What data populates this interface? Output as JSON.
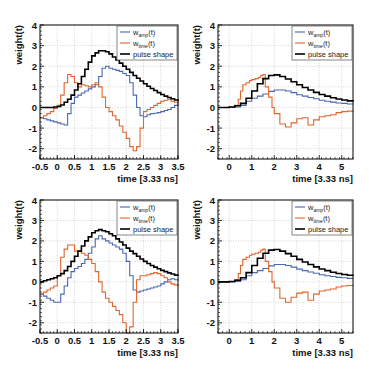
{
  "colors": {
    "amp": "#4a68b0",
    "time": "#e0662e",
    "pulse": "#000000",
    "grid": "#b8b8b8",
    "axis": "#000000"
  },
  "legend": {
    "amp_main": "w",
    "amp_sub": "amp",
    "amp_tail": "(t)",
    "time_main": "w",
    "time_sub": "time",
    "time_tail": "(t)",
    "pulse": "pulse shape"
  },
  "chart_data": [
    {
      "type": "line",
      "panel": "top-left",
      "title": "",
      "xlabel": "time [3.33 ns]",
      "ylabel": "weight(t)",
      "xlim": [
        -0.5,
        3.5
      ],
      "ylim": [
        -2.5,
        4
      ],
      "xticks": [
        -0.5,
        0,
        0.5,
        1,
        1.5,
        2,
        2.5,
        3,
        3.5
      ],
      "xtick_labels": [
        "-0.5",
        "0",
        "0.5",
        "1",
        "1.5",
        "2",
        "2.5",
        "3",
        "3.5"
      ],
      "yticks": [
        -2,
        -1,
        0,
        1,
        2,
        3,
        4
      ],
      "ytick_labels": [
        "-2",
        "-1",
        "0",
        "1",
        "2",
        "3",
        "4"
      ],
      "grid": true,
      "legend_position": "upper right",
      "step": true,
      "series": [
        {
          "name": "w_amp(t)",
          "x": [
            -0.5,
            -0.4,
            -0.3,
            -0.2,
            -0.1,
            0,
            0.1,
            0.2,
            0.3,
            0.4,
            0.5,
            0.6,
            0.7,
            0.8,
            0.9,
            1.0,
            1.1,
            1.2,
            1.3,
            1.4,
            1.5,
            1.6,
            1.7,
            1.8,
            1.9,
            2.0,
            2.1,
            2.2,
            2.3,
            2.4,
            2.5,
            2.6,
            2.7,
            2.8,
            2.9,
            3.0,
            3.1,
            3.2,
            3.3,
            3.4,
            3.5
          ],
          "y": [
            -0.5,
            -0.55,
            -0.6,
            -0.65,
            -0.7,
            -0.75,
            -0.8,
            -0.85,
            -0.3,
            0.2,
            0.5,
            0.6,
            0.7,
            0.8,
            0.9,
            1.0,
            1.1,
            1.5,
            1.9,
            2.0,
            1.9,
            1.85,
            1.8,
            1.75,
            1.65,
            1.55,
            1.2,
            0.6,
            0,
            -0.4,
            -0.45,
            -0.35,
            -0.3,
            -0.28,
            -0.25,
            -0.2,
            -0.15,
            -0.1,
            0,
            0.1,
            0.2
          ]
        },
        {
          "name": "w_time(t)",
          "x": [
            -0.5,
            -0.4,
            -0.3,
            -0.2,
            -0.1,
            0,
            0.1,
            0.2,
            0.3,
            0.4,
            0.5,
            0.6,
            0.7,
            0.8,
            0.9,
            1.0,
            1.1,
            1.2,
            1.3,
            1.4,
            1.5,
            1.6,
            1.7,
            1.8,
            1.9,
            2.0,
            2.1,
            2.2,
            2.3,
            2.4,
            2.5,
            2.6,
            2.7,
            2.8,
            2.9,
            3.0,
            3.1,
            3.2,
            3.3,
            3.4,
            3.5
          ],
          "y": [
            -0.5,
            -0.4,
            -0.3,
            -0.2,
            -0.05,
            0.1,
            0.6,
            1.2,
            1.6,
            1.5,
            1.2,
            1.0,
            1.1,
            1.05,
            1.0,
            1.1,
            1.2,
            1.0,
            0.5,
            0,
            -0.2,
            -0.4,
            -0.6,
            -0.9,
            -1.2,
            -1.5,
            -1.9,
            -2.1,
            -1.9,
            -1.0,
            -0.2,
            -0.1,
            0,
            0.1,
            0.2,
            0.3,
            0.35,
            0.4,
            0.3,
            0.25,
            0.2
          ]
        },
        {
          "name": "pulse shape",
          "x": [
            -0.5,
            -0.4,
            -0.3,
            -0.2,
            -0.1,
            0,
            0.1,
            0.2,
            0.3,
            0.4,
            0.5,
            0.6,
            0.7,
            0.8,
            0.9,
            1.0,
            1.1,
            1.2,
            1.3,
            1.4,
            1.5,
            1.6,
            1.7,
            1.8,
            1.9,
            2.0,
            2.1,
            2.2,
            2.3,
            2.4,
            2.5,
            2.6,
            2.7,
            2.8,
            2.9,
            3.0,
            3.1,
            3.2,
            3.3,
            3.4,
            3.5
          ],
          "y": [
            0,
            0,
            0,
            0,
            0.02,
            0.05,
            0.12,
            0.25,
            0.4,
            0.6,
            0.85,
            1.15,
            1.5,
            1.85,
            2.2,
            2.5,
            2.65,
            2.75,
            2.75,
            2.7,
            2.6,
            2.45,
            2.3,
            2.15,
            2.0,
            1.85,
            1.7,
            1.55,
            1.42,
            1.28,
            1.15,
            1.03,
            0.92,
            0.82,
            0.72,
            0.63,
            0.55,
            0.48,
            0.42,
            0.36,
            0.3
          ]
        }
      ]
    },
    {
      "type": "line",
      "panel": "top-right",
      "title": "",
      "xlabel": "time [3.33 ns]",
      "ylabel": "weight(t)",
      "xlim": [
        -0.5,
        5.5
      ],
      "ylim": [
        -2.5,
        4
      ],
      "xticks": [
        0,
        1,
        2,
        3,
        4,
        5
      ],
      "xtick_labels": [
        "0",
        "1",
        "2",
        "3",
        "4",
        "5"
      ],
      "yticks": [
        -2,
        -1,
        0,
        1,
        2,
        3,
        4
      ],
      "ytick_labels": [
        "-2",
        "-1",
        "0",
        "1",
        "2",
        "3",
        "4"
      ],
      "grid": true,
      "legend_position": "upper right",
      "step": true,
      "series": [
        {
          "name": "w_amp(t)",
          "x": [
            -0.5,
            0,
            0.25,
            0.5,
            0.75,
            1.0,
            1.25,
            1.5,
            1.75,
            2.0,
            2.25,
            2.5,
            2.75,
            3.0,
            3.25,
            3.5,
            3.75,
            4.0,
            4.25,
            4.5,
            4.75,
            5.0,
            5.25,
            5.5
          ],
          "y": [
            0,
            0,
            0.02,
            0.1,
            0.3,
            0.45,
            0.55,
            0.65,
            0.78,
            0.85,
            0.85,
            0.8,
            0.72,
            0.62,
            0.55,
            0.48,
            0.42,
            0.35,
            0.3,
            0.26,
            0.22,
            0.2,
            0.17,
            0.15
          ]
        },
        {
          "name": "w_time(t)",
          "x": [
            -0.5,
            0,
            0.25,
            0.4,
            0.5,
            0.6,
            0.75,
            0.9,
            1.0,
            1.15,
            1.3,
            1.4,
            1.5,
            1.6,
            1.75,
            1.9,
            2.0,
            2.25,
            2.5,
            2.75,
            3.0,
            3.25,
            3.5,
            3.75,
            4.0,
            4.25,
            4.5,
            4.75,
            5.0,
            5.25,
            5.5
          ],
          "y": [
            0,
            0.02,
            0.1,
            0.4,
            0.8,
            1.1,
            1.2,
            1.3,
            1.35,
            1.4,
            1.45,
            1.55,
            1.6,
            1.0,
            0.5,
            0,
            -0.3,
            -0.8,
            -0.95,
            -0.75,
            -0.55,
            -0.5,
            -0.85,
            -0.6,
            -0.45,
            -0.4,
            -0.35,
            -0.25,
            -0.2,
            -0.18,
            -0.2
          ]
        },
        {
          "name": "pulse shape",
          "x": [
            -0.5,
            0,
            0.25,
            0.5,
            0.75,
            1.0,
            1.25,
            1.5,
            1.75,
            2.0,
            2.25,
            2.5,
            2.75,
            3.0,
            3.25,
            3.5,
            3.75,
            4.0,
            4.25,
            4.5,
            4.75,
            5.0,
            5.25,
            5.5
          ],
          "y": [
            0,
            0.02,
            0.08,
            0.2,
            0.45,
            0.8,
            1.15,
            1.4,
            1.55,
            1.58,
            1.5,
            1.38,
            1.25,
            1.1,
            0.97,
            0.85,
            0.73,
            0.63,
            0.55,
            0.47,
            0.41,
            0.36,
            0.32,
            0.28
          ]
        }
      ]
    },
    {
      "type": "line",
      "panel": "bottom-left",
      "title": "",
      "xlabel": "time [3.33 ns]",
      "ylabel": "weight(t)",
      "xlim": [
        -0.5,
        3.5
      ],
      "ylim": [
        -2.5,
        4
      ],
      "xticks": [
        -0.5,
        0,
        0.5,
        1,
        1.5,
        2,
        2.5,
        3,
        3.5
      ],
      "xtick_labels": [
        "-0.5",
        "0",
        "0.5",
        "1",
        "1.5",
        "2",
        "2.5",
        "3",
        "3.5"
      ],
      "yticks": [
        -2,
        -1,
        0,
        1,
        2,
        3,
        4
      ],
      "ytick_labels": [
        "-2",
        "-1",
        "0",
        "1",
        "2",
        "3",
        "4"
      ],
      "grid": true,
      "legend_position": "upper right",
      "step": true,
      "series": [
        {
          "name": "w_amp(t)",
          "x": [
            -0.5,
            -0.4,
            -0.3,
            -0.2,
            -0.1,
            0,
            0.1,
            0.2,
            0.3,
            0.4,
            0.5,
            0.6,
            0.7,
            0.8,
            0.9,
            1.0,
            1.1,
            1.2,
            1.3,
            1.4,
            1.5,
            1.6,
            1.7,
            1.8,
            1.9,
            2.0,
            2.1,
            2.2,
            2.3,
            2.4,
            2.5,
            2.6,
            2.7,
            2.8,
            2.9,
            3.0,
            3.1,
            3.2,
            3.3,
            3.4,
            3.5
          ],
          "y": [
            -0.6,
            -0.7,
            -0.8,
            -0.9,
            -1.0,
            -1.0,
            -0.6,
            -0.2,
            0.2,
            0.5,
            0.65,
            0.75,
            0.9,
            1.1,
            1.4,
            1.7,
            2.1,
            2.25,
            2.1,
            2.0,
            1.9,
            1.8,
            1.7,
            1.6,
            1.4,
            1.0,
            0.3,
            -0.4,
            -0.5,
            -0.45,
            -0.4,
            -0.35,
            -0.3,
            -0.25,
            -0.2,
            -0.1,
            0,
            0.1,
            0.15,
            0.1,
            0.05
          ]
        },
        {
          "name": "w_time(t)",
          "x": [
            -0.5,
            -0.4,
            -0.3,
            -0.2,
            -0.1,
            0,
            0.1,
            0.2,
            0.3,
            0.4,
            0.5,
            0.6,
            0.7,
            0.8,
            0.9,
            1.0,
            1.1,
            1.2,
            1.3,
            1.4,
            1.5,
            1.6,
            1.7,
            1.8,
            1.9,
            2.0,
            2.1,
            2.2,
            2.3,
            2.4,
            2.5,
            2.6,
            2.7,
            2.8,
            2.9,
            3.0,
            3.1,
            3.2,
            3.3,
            3.4,
            3.5
          ],
          "y": [
            -0.6,
            -0.5,
            -0.4,
            -0.3,
            -0.2,
            0.3,
            1.2,
            1.6,
            1.8,
            1.8,
            1.5,
            1.5,
            1.4,
            1.3,
            1.1,
            0.9,
            0.5,
            0,
            -0.5,
            -0.8,
            -1.0,
            -1.2,
            -1.4,
            -1.6,
            -2.0,
            -2.5,
            -2.2,
            -1.0,
            0.1,
            0.3,
            0.3,
            0.35,
            0.4,
            0.45,
            0.4,
            0.3,
            0.2,
            0,
            -0.1,
            -0.15,
            -0.2
          ]
        },
        {
          "name": "pulse shape",
          "x": [
            -0.5,
            -0.4,
            -0.3,
            -0.2,
            -0.1,
            0,
            0.1,
            0.2,
            0.3,
            0.4,
            0.5,
            0.6,
            0.7,
            0.8,
            0.9,
            1.0,
            1.1,
            1.2,
            1.3,
            1.4,
            1.5,
            1.6,
            1.7,
            1.8,
            1.9,
            2.0,
            2.1,
            2.2,
            2.3,
            2.4,
            2.5,
            2.6,
            2.7,
            2.8,
            2.9,
            3.0,
            3.1,
            3.2,
            3.3,
            3.4,
            3.5
          ],
          "y": [
            0,
            0.05,
            0.1,
            0.15,
            0.2,
            0.3,
            0.4,
            0.55,
            0.75,
            1.0,
            1.25,
            1.5,
            1.75,
            2.0,
            2.2,
            2.4,
            2.5,
            2.55,
            2.5,
            2.45,
            2.35,
            2.25,
            2.1,
            1.95,
            1.8,
            1.65,
            1.5,
            1.38,
            1.25,
            1.12,
            1.0,
            0.9,
            0.8,
            0.72,
            0.64,
            0.56,
            0.5,
            0.44,
            0.38,
            0.33,
            0.3
          ]
        }
      ]
    },
    {
      "type": "line",
      "panel": "bottom-right",
      "title": "",
      "xlabel": "time [3.33 ns]",
      "ylabel": "weight(t)",
      "xlim": [
        -0.5,
        5.5
      ],
      "ylim": [
        -2.5,
        4
      ],
      "xticks": [
        0,
        1,
        2,
        3,
        4,
        5
      ],
      "xtick_labels": [
        "0",
        "1",
        "2",
        "3",
        "4",
        "5"
      ],
      "yticks": [
        -2,
        -1,
        0,
        1,
        2,
        3,
        4
      ],
      "ytick_labels": [
        "-2",
        "-1",
        "0",
        "1",
        "2",
        "3",
        "4"
      ],
      "grid": true,
      "legend_position": "upper right",
      "step": true,
      "series": [
        {
          "name": "w_amp(t)",
          "x": [
            -0.5,
            0,
            0.25,
            0.5,
            0.75,
            1.0,
            1.25,
            1.5,
            1.75,
            2.0,
            2.25,
            2.5,
            2.75,
            3.0,
            3.25,
            3.5,
            3.75,
            4.0,
            4.25,
            4.5,
            4.75,
            5.0,
            5.25,
            5.5
          ],
          "y": [
            0,
            0,
            0.02,
            0.1,
            0.3,
            0.45,
            0.55,
            0.65,
            0.78,
            0.85,
            0.85,
            0.8,
            0.72,
            0.62,
            0.55,
            0.48,
            0.42,
            0.35,
            0.3,
            0.26,
            0.22,
            0.2,
            0.17,
            0.15
          ]
        },
        {
          "name": "w_time(t)",
          "x": [
            -0.5,
            0,
            0.25,
            0.4,
            0.5,
            0.6,
            0.75,
            0.9,
            1.0,
            1.15,
            1.3,
            1.4,
            1.5,
            1.6,
            1.75,
            1.9,
            2.0,
            2.25,
            2.5,
            2.75,
            3.0,
            3.25,
            3.5,
            3.75,
            4.0,
            4.25,
            4.5,
            4.75,
            5.0,
            5.25,
            5.5
          ],
          "y": [
            0,
            0.02,
            0.1,
            0.4,
            0.8,
            1.1,
            1.2,
            1.3,
            1.35,
            1.4,
            1.45,
            1.55,
            1.6,
            1.0,
            0.5,
            0,
            -0.3,
            -0.8,
            -1.0,
            -0.75,
            -0.55,
            -0.5,
            -0.9,
            -0.6,
            -0.45,
            -0.4,
            -0.35,
            -0.25,
            -0.2,
            -0.18,
            -0.2
          ]
        },
        {
          "name": "pulse shape",
          "x": [
            -0.5,
            0,
            0.25,
            0.5,
            0.75,
            1.0,
            1.25,
            1.5,
            1.75,
            2.0,
            2.25,
            2.5,
            2.75,
            3.0,
            3.25,
            3.5,
            3.75,
            4.0,
            4.25,
            4.5,
            4.75,
            5.0,
            5.25,
            5.5
          ],
          "y": [
            0,
            0.02,
            0.08,
            0.2,
            0.45,
            0.8,
            1.15,
            1.4,
            1.55,
            1.58,
            1.5,
            1.38,
            1.25,
            1.1,
            0.97,
            0.85,
            0.73,
            0.63,
            0.55,
            0.47,
            0.41,
            0.36,
            0.32,
            0.28
          ]
        }
      ]
    }
  ]
}
